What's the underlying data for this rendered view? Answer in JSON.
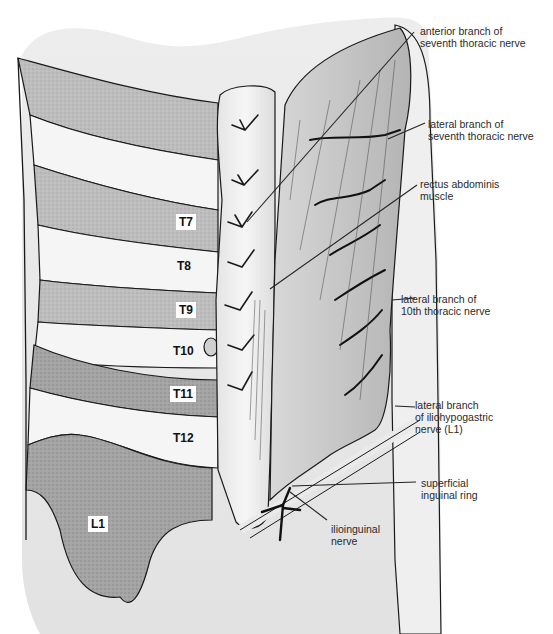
{
  "figure": {
    "type": "anatomical illustration",
    "colors": {
      "background": "#ffffff",
      "skin": "#e6e6e6",
      "band_light": "#f4f4f4",
      "band_shaded": "#b8b8b8",
      "band_dark": "#9a9a9a",
      "muscle": "#c8c8c8",
      "muscle_sheath": "#ececec",
      "outline": "#1a1a1a",
      "leader": "#222222"
    }
  },
  "dermatomes": [
    {
      "id": "T7",
      "label": "T7",
      "boxed": true
    },
    {
      "id": "T8",
      "label": "T8",
      "boxed": false
    },
    {
      "id": "T9",
      "label": "T9",
      "boxed": true
    },
    {
      "id": "T10",
      "label": "T10",
      "boxed": false
    },
    {
      "id": "T11",
      "label": "T11",
      "boxed": true
    },
    {
      "id": "T12",
      "label": "T12",
      "boxed": false
    },
    {
      "id": "L1",
      "label": "L1",
      "boxed": true
    }
  ],
  "annotations": [
    {
      "id": "anterior-branch-7th",
      "text": "anterior branch of\nseventh thoracic nerve"
    },
    {
      "id": "lateral-branch-7th",
      "text": "lateral branch of\nseventh thoracic nerve"
    },
    {
      "id": "rectus-abdominis",
      "text": "rectus abdominis\nmuscle"
    },
    {
      "id": "lateral-branch-10th",
      "text": "lateral branch of\n10th thoracic nerve"
    },
    {
      "id": "lateral-branch-iliohypogastric",
      "text": "lateral branch\nof iliohypogastric\nnerve (L1)"
    },
    {
      "id": "superficial-inguinal-ring",
      "text": "superficial\ninguinal ring"
    },
    {
      "id": "ilioinguinal-nerve",
      "text": "ilioinguinal\nnerve"
    }
  ]
}
